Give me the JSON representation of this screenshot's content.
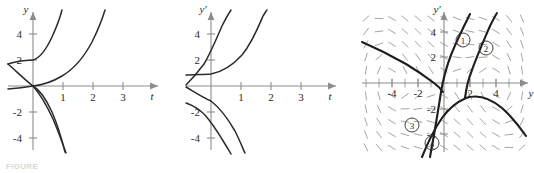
{
  "figure": {
    "caption": "FIGURE",
    "panel_count": 3
  },
  "panels": [
    {
      "id": "panel-1",
      "name": "solution-curves-y-vs-t",
      "y_axis_label": "y",
      "x_axis_label": "t",
      "y_ticks": [
        "4",
        "2",
        "-2",
        "-4"
      ],
      "x_ticks": [
        "1",
        "2",
        "3"
      ],
      "curve_count": 3
    },
    {
      "id": "panel-2",
      "name": "solution-curves-yprime-vs-t",
      "y_axis_label": "y'",
      "x_axis_label": "t",
      "y_ticks": [
        "4",
        "2",
        "-2",
        "-4"
      ],
      "x_ticks": [
        "1",
        "2",
        "3"
      ],
      "curve_count": 3
    },
    {
      "id": "panel-3",
      "name": "direction-field-with-trajectories",
      "y_axis_label": "y'",
      "x_axis_label": "y",
      "y_ticks": [
        "4",
        "2",
        "-2",
        "-4"
      ],
      "x_ticks": [
        "-4",
        "-2",
        "2",
        "4"
      ],
      "trajectory_labels": [
        "1",
        "2",
        "3",
        "4"
      ],
      "has_slope_field": true
    }
  ],
  "chart_data": [
    {
      "type": "line",
      "title": "",
      "xlabel": "t",
      "ylabel": "y",
      "xlim": [
        -0.55,
        3.9
      ],
      "ylim": [
        -5.6,
        5.6
      ],
      "grid": false,
      "legend": "none",
      "xticks": [
        1,
        2,
        3
      ],
      "yticks": [
        -4,
        -2,
        2,
        4
      ],
      "series": [
        {
          "name": "curve-A-rising-steep",
          "comment": "rises from near (-0.5,1.7) through (0,2) to off-top near t=0.75",
          "x": [
            -0.55,
            -0.3,
            -0.1,
            0.0,
            0.15,
            0.3,
            0.45,
            0.6,
            0.72
          ],
          "y": [
            1.7,
            1.8,
            1.95,
            2.05,
            2.4,
            3.1,
            4.1,
            5.2,
            5.7
          ]
        },
        {
          "name": "curve-B-rising-shallow",
          "comment": "passes through origin, rises to off-top near t=2.3",
          "x": [
            0.0,
            0.3,
            0.6,
            0.9,
            1.2,
            1.5,
            1.8,
            2.05,
            2.25
          ],
          "y": [
            0.0,
            0.15,
            0.45,
            0.85,
            1.4,
            2.2,
            3.3,
            4.6,
            5.7
          ]
        },
        {
          "name": "curve-C-falling-left-branch",
          "comment": "from (-0.55,-0.25) through origin falling to off-bottom near t=0.85",
          "x": [
            -0.55,
            -0.3,
            -0.1,
            0.0,
            0.2,
            0.4,
            0.6,
            0.75,
            0.88
          ],
          "y": [
            -0.25,
            -0.2,
            -0.1,
            0.0,
            -0.55,
            -1.5,
            -3.0,
            -4.4,
            -5.7
          ]
        },
        {
          "name": "curve-D-falling-through-two",
          "comment": "from (-0.55,1.7) decreasing through origin then plunging near t=1.0",
          "x": [
            -0.55,
            -0.35,
            -0.15,
            0.0,
            0.25,
            0.5,
            0.75,
            0.95,
            1.05
          ],
          "y": [
            1.7,
            1.3,
            0.7,
            0.05,
            -0.85,
            -2.0,
            -3.6,
            -5.0,
            -5.7
          ]
        }
      ]
    },
    {
      "type": "line",
      "title": "",
      "xlabel": "t",
      "ylabel": "y'",
      "xlim": [
        -0.55,
        3.9
      ],
      "ylim": [
        -5.6,
        5.6
      ],
      "grid": false,
      "legend": "none",
      "xticks": [
        1,
        2,
        3
      ],
      "yticks": [
        -4,
        -2,
        2,
        4
      ],
      "series": [
        {
          "name": "curve-A-steep-rise",
          "comment": "from (-0.55,0.05) rising through (0,2.1) to off-top near t=0.7",
          "x": [
            -0.55,
            -0.4,
            -0.25,
            -0.1,
            0.05,
            0.2,
            0.38,
            0.55,
            0.68
          ],
          "y": [
            0.05,
            0.5,
            1.1,
            1.7,
            2.4,
            3.2,
            4.3,
            5.3,
            5.7
          ]
        },
        {
          "name": "curve-B-shallow-rise",
          "comment": "from (-0.55,0.85) flat then rising off-top near t=2.05",
          "x": [
            -0.55,
            -0.25,
            0.1,
            0.45,
            0.8,
            1.15,
            1.45,
            1.75,
            2.0
          ],
          "y": [
            0.85,
            0.82,
            0.85,
            1.0,
            1.3,
            1.9,
            2.8,
            4.2,
            5.7
          ]
        },
        {
          "name": "curve-C-shallow-fall",
          "comment": "from (-0.55,-0.1) descending through (0,-1.1) off-bottom near t=0.95",
          "x": [
            -0.55,
            -0.4,
            -0.2,
            0.0,
            0.2,
            0.45,
            0.68,
            0.85,
            0.97
          ],
          "y": [
            -0.1,
            -0.35,
            -0.7,
            -1.15,
            -1.8,
            -2.9,
            -4.2,
            -5.2,
            -5.7
          ]
        },
        {
          "name": "curve-D-steep-fall",
          "comment": "from (-0.55,-1.3) descending off-bottom near t=0.9",
          "x": [
            -0.55,
            -0.42,
            -0.25,
            -0.05,
            0.18,
            0.42,
            0.65,
            0.82,
            0.93
          ],
          "y": [
            -1.3,
            -1.45,
            -1.75,
            -2.2,
            -2.95,
            -3.9,
            -4.9,
            -5.5,
            -5.8
          ]
        }
      ]
    },
    {
      "type": "line",
      "title": "",
      "xlabel": "y",
      "ylabel": "y'",
      "xlim": [
        -5.9,
        5.9
      ],
      "ylim": [
        -5.9,
        5.9
      ],
      "grid": false,
      "legend": "none",
      "xticks": [
        -4,
        -2,
        2,
        4
      ],
      "yticks": [
        -4,
        -2,
        2,
        4
      ],
      "annotations": [
        "1",
        "2",
        "3",
        "4"
      ],
      "slope_field": true,
      "series": [
        {
          "name": "trajectory-1",
          "comment": "steep line from lower-left saddle region through origin up to top-right; labeled 1",
          "x": [
            -1.1,
            -0.5,
            0.0,
            0.45,
            0.9,
            1.4,
            1.9,
            2.3
          ],
          "y": [
            -5.9,
            -3.0,
            -0.45,
            1.6,
            3.2,
            4.6,
            5.5,
            5.9
          ]
        },
        {
          "name": "trajectory-2",
          "comment": "parallel steep curve to the right of trajectory 1; labeled 2",
          "x": [
            1.6,
            1.75,
            1.95,
            2.2,
            2.6,
            3.0,
            3.4,
            3.7
          ],
          "y": [
            -1.2,
            0.3,
            1.6,
            2.9,
            4.1,
            5.1,
            5.7,
            5.9
          ]
        },
        {
          "name": "trajectory-3",
          "comment": "separatrix from upper-left down to the saddle near origin; labeled 3",
          "x": [
            -5.9,
            -4.2,
            -2.8,
            -1.6,
            -0.8,
            -0.3,
            0.0
          ],
          "y": [
            3.2,
            2.3,
            1.5,
            0.8,
            0.25,
            -0.1,
            -0.45
          ]
        },
        {
          "name": "trajectory-4",
          "comment": "curve descending from saddle toward lower-left; labeled 4",
          "x": [
            -1.6,
            -1.0,
            -0.4,
            0.1,
            0.6,
            1.2,
            2.0,
            3.1,
            4.4,
            5.9
          ],
          "y": [
            -5.9,
            -4.4,
            -3.1,
            -2.2,
            -1.6,
            -1.2,
            -1.1,
            -1.5,
            -2.3,
            -3.4
          ]
        }
      ]
    }
  ]
}
